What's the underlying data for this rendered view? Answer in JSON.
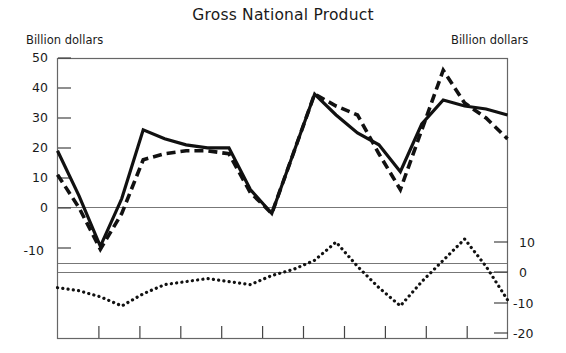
{
  "chart_data": {
    "type": "line",
    "title": "Gross National Product",
    "xlabel": "",
    "ylabel": "Billion dollars",
    "ylabel_right": "Billion dollars",
    "grid": false,
    "legend": "none",
    "panels": [
      {
        "name": "upper-panel",
        "ylim": [
          -18,
          50
        ],
        "yticks": [
          50,
          40,
          30,
          20,
          10,
          0,
          -10
        ],
        "ytick_labels": [
          "50",
          "40",
          "30",
          "20",
          "10",
          "0",
          "-10"
        ],
        "zero_line": 0,
        "series": [
          {
            "name": "solid-series",
            "style": "solid",
            "x": [
              0,
              1,
              2,
              3,
              4,
              5,
              6,
              7,
              8,
              9,
              10,
              11,
              12,
              13,
              14,
              15,
              16,
              17,
              18,
              19,
              20,
              21
            ],
            "values": [
              19,
              4,
              -13,
              3,
              26,
              23,
              21,
              20,
              20,
              6,
              -2,
              18,
              38,
              31,
              25,
              21,
              12,
              28,
              36,
              34,
              33,
              31
            ]
          },
          {
            "name": "dashed-series",
            "style": "dashed",
            "x": [
              0,
              1,
              2,
              3,
              4,
              5,
              6,
              7,
              8,
              9,
              10,
              11,
              12,
              13,
              14,
              15,
              16,
              17,
              18,
              19,
              20,
              21
            ],
            "values": [
              11,
              0,
              -14,
              -2,
              16,
              18,
              19,
              19,
              18,
              5,
              -2,
              18,
              38,
              34,
              31,
              18,
              6,
              26,
              46,
              35,
              30,
              23
            ]
          }
        ]
      },
      {
        "name": "lower-panel",
        "ylim": [
          -20,
          14
        ],
        "yticks": [
          10,
          0,
          -10,
          -20
        ],
        "ytick_labels": [
          "10",
          "0",
          "-10",
          "-20"
        ],
        "zero_line": 0,
        "series": [
          {
            "name": "dotted-series",
            "style": "dotted",
            "x": [
              0,
              1,
              2,
              3,
              4,
              5,
              6,
              7,
              8,
              9,
              10,
              11,
              12,
              13,
              14,
              15,
              16,
              17,
              18,
              19,
              20,
              21
            ],
            "values": [
              -5,
              -6,
              -8,
              -11,
              -7,
              -4,
              -3,
              -2,
              -3,
              -4,
              -1,
              1,
              4,
              10,
              2,
              -5,
              -11,
              -3,
              4,
              11,
              2,
              -9
            ]
          }
        ]
      }
    ],
    "x_axis": {
      "n_ticks": 12,
      "tick_labels": []
    },
    "colors": {
      "line": "#111111",
      "axis": "#555555",
      "background": "#ffffff"
    }
  }
}
